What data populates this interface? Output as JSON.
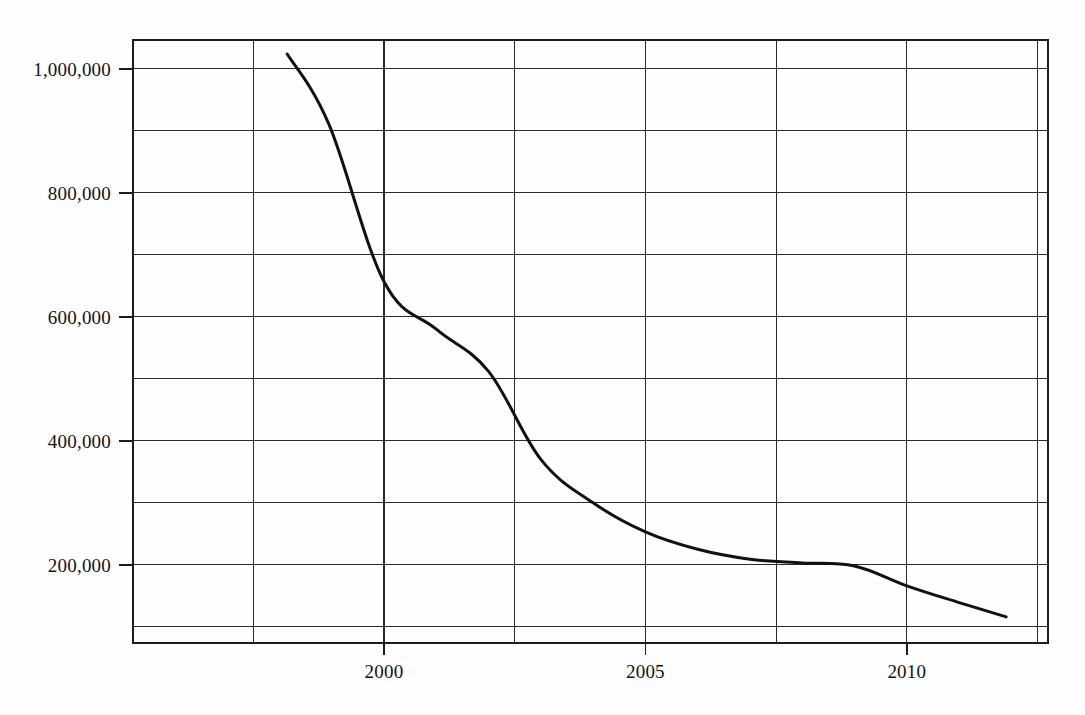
{
  "chart_data": {
    "type": "line",
    "title": "",
    "subtitle": "",
    "xlabel": "",
    "ylabel": "",
    "xlim": [
      1995.2,
      2012.7
    ],
    "ylim": [
      73800,
      1046600
    ],
    "grid": true,
    "legend": false,
    "legend_position": "none",
    "x_tick_labels": [
      "2000",
      "2005",
      "2010"
    ],
    "x_tick_values": [
      2000,
      2005,
      2010
    ],
    "x_gridline_values": [
      1995.2,
      1997.5,
      2000,
      2002.5,
      2005,
      2007.5,
      2010,
      2012.5
    ],
    "y_tick_labels": [
      "200,000",
      "400,000",
      "600,000",
      "800,000",
      "1,000,000"
    ],
    "y_tick_values": [
      200000,
      400000,
      600000,
      800000,
      1000000
    ],
    "y_gridline_values": [
      100000,
      200000,
      300000,
      400000,
      500000,
      600000,
      700000,
      800000,
      900000,
      1000000
    ],
    "series": [
      {
        "name": "value",
        "color": "#111111",
        "x": [
          1998.15,
          1998.95,
          2000.0,
          2001.0,
          2002.0,
          2003.0,
          2004.0,
          2005.0,
          2006.0,
          2007.0,
          2008.0,
          2009.0,
          2010.0,
          2011.0,
          2011.9
        ],
        "values": [
          1024000,
          910000,
          657000,
          580000,
          512000,
          370000,
          300000,
          253000,
          225000,
          209000,
          203000,
          198000,
          166000,
          139000,
          116000
        ]
      }
    ]
  }
}
